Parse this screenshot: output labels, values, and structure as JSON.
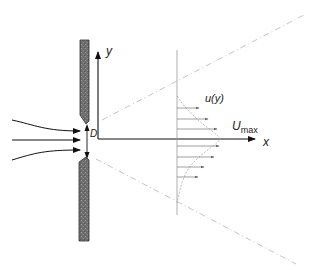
{
  "diagram": {
    "type": "free-jet-from-orifice",
    "labels": {
      "y_axis": "y",
      "x_axis": "x",
      "orifice_diameter": "D",
      "velocity_profile": "u(y)",
      "umax_main": "U",
      "umax_sub": "max"
    },
    "colors": {
      "wall_fill": "#6b6b6b",
      "wall_edge": "#333333",
      "axis": "#111111",
      "dashed": "#bdbdbd",
      "profile": "#888888"
    },
    "elements": [
      "orifice-plate wall (upper and lower sections)",
      "three inflow streamline arrows",
      "D dimension arrow across orifice",
      "y axis arrow",
      "x axis arrow",
      "two dash-dot jet spreading lines",
      "velocity profile u(y) with horizontal arrows and U_max at centreline"
    ]
  }
}
